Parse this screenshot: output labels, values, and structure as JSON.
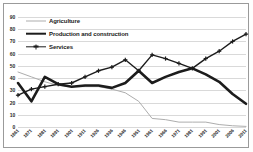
{
  "chart_data": {
    "type": "line",
    "title": "",
    "xlabel": "",
    "ylabel": "",
    "ylim": [
      0,
      90
    ],
    "ytick_step": 10,
    "yticks": [
      0,
      10,
      20,
      30,
      40,
      50,
      60,
      70,
      80,
      90
    ],
    "grid": true,
    "legend_position": "top-left-inside",
    "categories": [
      "1861",
      "1871",
      "1881",
      "1891",
      "1901",
      "1911",
      "1926",
      "1936",
      "1946",
      "1951",
      "1961",
      "1966",
      "1971",
      "1981",
      "1991",
      "2001",
      "2006",
      "2011"
    ],
    "series": [
      {
        "name": "Agriculture",
        "color": "#adadad",
        "marker": "none",
        "width": 1,
        "values": [
          45,
          41,
          37,
          34,
          33,
          33,
          33,
          31,
          28,
          21,
          7,
          6,
          4,
          4,
          4,
          2,
          1,
          0.5
        ]
      },
      {
        "name": "Production and construction",
        "color": "#1c1c1c",
        "marker": "none",
        "width": 2.6,
        "values": [
          36,
          21,
          41,
          35,
          33,
          34,
          34,
          32,
          36,
          46,
          36,
          41,
          45,
          48,
          43,
          37,
          27,
          19
        ]
      },
      {
        "name": "Services",
        "color": "#1c1c1c",
        "marker": "cross",
        "width": 1.4,
        "values": [
          26,
          31,
          33,
          35,
          36,
          41,
          46,
          49,
          55,
          46,
          59,
          56,
          52,
          48,
          56,
          62,
          70,
          76
        ]
      }
    ]
  },
  "legend": {
    "items": [
      {
        "label": "Agriculture"
      },
      {
        "label": "Production and construction"
      },
      {
        "label": "Services"
      }
    ]
  }
}
